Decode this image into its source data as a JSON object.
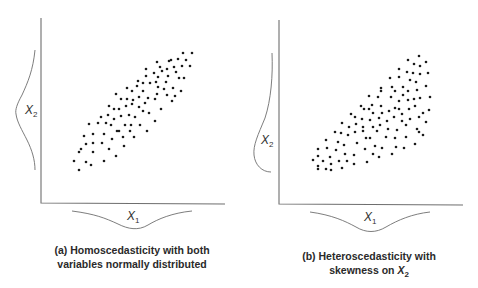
{
  "panels": [
    {
      "id": "a",
      "caption_line1": "(a) Homoscedasticity with both",
      "caption_line2": "variables normally distributed",
      "x_label": "X",
      "x_label_sub": "1",
      "y_label": "X",
      "y_label_sub": "2",
      "x_marginal": "normal",
      "y_marginal": "normal"
    },
    {
      "id": "b",
      "caption_line1": "(b) Heteroscedasticity with",
      "caption_line2_prefix": "skewness on ",
      "caption_line2_var": "X",
      "caption_line2_sub": "2",
      "x_label": "X",
      "x_label_sub": "1",
      "y_label": "X",
      "y_label_sub": "2",
      "x_marginal": "normal",
      "y_marginal": "skewed"
    }
  ],
  "chart_data": [
    {
      "type": "scatter",
      "title": "(a) Homoscedasticity with both variables normally distributed",
      "xlabel": "X1",
      "ylabel": "X2",
      "grid": false,
      "description": "Elliptical point cloud with constant spread along a positive linear trend; normal marginal curves on both axes",
      "points_px": [
        [
          183,
          53
        ],
        [
          192,
          53
        ],
        [
          178,
          59
        ],
        [
          186,
          60
        ],
        [
          171,
          60
        ],
        [
          169,
          61
        ],
        [
          157,
          62
        ],
        [
          160,
          67
        ],
        [
          167,
          69
        ],
        [
          174,
          67
        ],
        [
          182,
          66
        ],
        [
          190,
          66
        ],
        [
          146,
          69
        ],
        [
          154,
          73
        ],
        [
          162,
          71
        ],
        [
          176,
          72
        ],
        [
          146,
          76
        ],
        [
          158,
          77
        ],
        [
          168,
          76
        ],
        [
          179,
          78
        ],
        [
          184,
          78
        ],
        [
          138,
          81
        ],
        [
          143,
          83
        ],
        [
          150,
          83
        ],
        [
          156,
          82
        ],
        [
          166,
          82
        ],
        [
          127,
          88
        ],
        [
          132,
          91
        ],
        [
          137,
          86
        ],
        [
          143,
          91
        ],
        [
          158,
          87
        ],
        [
          164,
          89
        ],
        [
          173,
          88
        ],
        [
          181,
          91
        ],
        [
          116,
          94
        ],
        [
          121,
          99
        ],
        [
          127,
          99
        ],
        [
          133,
          100
        ],
        [
          139,
          97
        ],
        [
          148,
          98
        ],
        [
          157,
          94
        ],
        [
          167,
          95
        ],
        [
          175,
          96
        ],
        [
          109,
          106
        ],
        [
          114,
          109
        ],
        [
          119,
          109
        ],
        [
          126,
          106
        ],
        [
          132,
          104
        ],
        [
          139,
          107
        ],
        [
          145,
          103
        ],
        [
          155,
          99
        ],
        [
          161,
          109
        ],
        [
          172,
          101
        ],
        [
          101,
          117
        ],
        [
          108,
          115
        ],
        [
          114,
          119
        ],
        [
          121,
          116
        ],
        [
          129,
          115
        ],
        [
          135,
          117
        ],
        [
          143,
          111
        ],
        [
          149,
          113
        ],
        [
          155,
          121
        ],
        [
          89,
          124
        ],
        [
          98,
          123
        ],
        [
          106,
          123
        ],
        [
          111,
          125
        ],
        [
          119,
          131
        ],
        [
          125,
          125
        ],
        [
          131,
          125
        ],
        [
          140,
          125
        ],
        [
          147,
          131
        ],
        [
          84,
          136
        ],
        [
          93,
          134
        ],
        [
          104,
          134
        ],
        [
          112,
          139
        ],
        [
          117,
          131
        ],
        [
          123,
          137
        ],
        [
          130,
          131
        ],
        [
          134,
          137
        ],
        [
          86,
          144
        ],
        [
          93,
          143
        ],
        [
          102,
          143
        ],
        [
          109,
          149
        ],
        [
          124,
          146
        ],
        [
          79,
          152
        ],
        [
          81,
          149
        ],
        [
          93,
          152
        ],
        [
          116,
          156
        ],
        [
          74,
          161
        ],
        [
          86,
          162
        ],
        [
          91,
          165
        ],
        [
          104,
          161
        ],
        [
          79,
          170
        ]
      ]
    },
    {
      "type": "scatter",
      "title": "(b) Heteroscedasticity with skewness on X2",
      "xlabel": "X1",
      "ylabel": "X2",
      "grid": false,
      "description": "Fan-shaped point cloud whose spread increases with X1; normal marginal on X1, skewed marginal on X2",
      "points_px": [
        [
          419,
          56
        ],
        [
          408,
          60
        ],
        [
          426,
          62
        ],
        [
          414,
          64
        ],
        [
          420,
          66
        ],
        [
          399,
          69
        ],
        [
          407,
          72
        ],
        [
          413,
          73
        ],
        [
          420,
          74
        ],
        [
          428,
          73
        ],
        [
          390,
          78
        ],
        [
          399,
          77
        ],
        [
          410,
          80
        ],
        [
          416,
          82
        ],
        [
          381,
          88
        ],
        [
          381,
          91
        ],
        [
          392,
          87
        ],
        [
          395,
          91
        ],
        [
          403,
          87
        ],
        [
          408,
          91
        ],
        [
          417,
          90
        ],
        [
          426,
          86
        ],
        [
          369,
          96
        ],
        [
          378,
          97
        ],
        [
          391,
          97
        ],
        [
          403,
          95
        ],
        [
          399,
          101
        ],
        [
          408,
          100
        ],
        [
          414,
          99
        ],
        [
          420,
          98
        ],
        [
          430,
          97
        ],
        [
          361,
          106
        ],
        [
          364,
          109
        ],
        [
          372,
          105
        ],
        [
          369,
          109
        ],
        [
          381,
          106
        ],
        [
          373,
          113
        ],
        [
          382,
          113
        ],
        [
          389,
          111
        ],
        [
          395,
          108
        ],
        [
          399,
          109
        ],
        [
          402,
          114
        ],
        [
          409,
          109
        ],
        [
          415,
          106
        ],
        [
          423,
          113
        ],
        [
          429,
          110
        ],
        [
          351,
          114
        ],
        [
          355,
          117
        ],
        [
          362,
          119
        ],
        [
          370,
          120
        ],
        [
          379,
          118
        ],
        [
          387,
          121
        ],
        [
          394,
          117
        ],
        [
          402,
          121
        ],
        [
          410,
          119
        ],
        [
          419,
          117
        ],
        [
          426,
          122
        ],
        [
          342,
          123
        ],
        [
          349,
          127
        ],
        [
          356,
          124
        ],
        [
          363,
          127
        ],
        [
          373,
          127
        ],
        [
          380,
          125
        ],
        [
          388,
          129
        ],
        [
          397,
          130
        ],
        [
          406,
          125
        ],
        [
          417,
          129
        ],
        [
          335,
          132
        ],
        [
          341,
          133
        ],
        [
          348,
          135
        ],
        [
          355,
          132
        ],
        [
          363,
          131
        ],
        [
          370,
          138
        ],
        [
          377,
          131
        ],
        [
          386,
          137
        ],
        [
          395,
          138
        ],
        [
          406,
          137
        ],
        [
          419,
          132
        ],
        [
          423,
          135
        ],
        [
          326,
          140
        ],
        [
          338,
          142
        ],
        [
          344,
          145
        ],
        [
          357,
          143
        ],
        [
          366,
          138
        ],
        [
          375,
          146
        ],
        [
          382,
          148
        ],
        [
          396,
          147
        ],
        [
          404,
          148
        ],
        [
          415,
          144
        ],
        [
          318,
          149
        ],
        [
          327,
          148
        ],
        [
          336,
          150
        ],
        [
          345,
          154
        ],
        [
          354,
          155
        ],
        [
          365,
          149
        ],
        [
          373,
          154
        ],
        [
          379,
          157
        ],
        [
          392,
          154
        ],
        [
          318,
          156
        ],
        [
          323,
          161
        ],
        [
          330,
          157
        ],
        [
          339,
          161
        ],
        [
          347,
          161
        ],
        [
          354,
          164
        ],
        [
          367,
          162
        ],
        [
          313,
          160
        ],
        [
          318,
          166
        ],
        [
          318,
          169
        ],
        [
          326,
          169
        ],
        [
          331,
          170
        ],
        [
          331,
          164
        ],
        [
          342,
          168
        ]
      ]
    }
  ]
}
